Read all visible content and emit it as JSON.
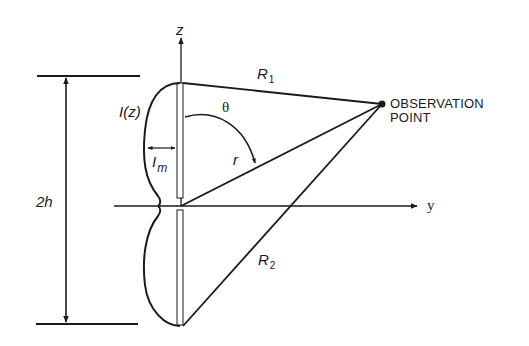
{
  "diagram": {
    "type": "dipole-antenna-geometry",
    "colors": {
      "ink": "#1a1a1a",
      "background": "#ffffff"
    },
    "labels": {
      "z_axis": "z",
      "y_axis": "y",
      "current_distribution": "I(z)",
      "max_current_base": "I",
      "max_current_sub": "m",
      "height": "2h",
      "theta": "θ",
      "r": "r",
      "R1_base": "R",
      "R1_sub": "1",
      "R2_base": "R",
      "R2_sub": "2",
      "observation_line1": "OBSERVATION",
      "observation_line2": "POINT"
    }
  }
}
